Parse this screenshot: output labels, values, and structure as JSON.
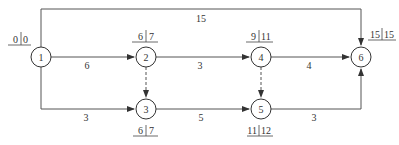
{
  "diagram": {
    "type": "network-schedule",
    "nodes": [
      {
        "id": "1",
        "label": "1",
        "est": "0",
        "lst": "0"
      },
      {
        "id": "2",
        "label": "2",
        "est": "6",
        "lst": "7"
      },
      {
        "id": "3",
        "label": "3",
        "est": "6",
        "lst": "7"
      },
      {
        "id": "4",
        "label": "4",
        "est": "9",
        "lst": "11"
      },
      {
        "id": "5",
        "label": "5",
        "est": "11",
        "lst": "12"
      },
      {
        "id": "6",
        "label": "6",
        "est": "15",
        "lst": "15"
      }
    ],
    "edges": [
      {
        "from": "1",
        "to": "6",
        "duration": "15",
        "style": "solid"
      },
      {
        "from": "1",
        "to": "2",
        "duration": "6",
        "style": "solid"
      },
      {
        "from": "1",
        "to": "3",
        "duration": "3",
        "style": "solid"
      },
      {
        "from": "2",
        "to": "4",
        "duration": "3",
        "style": "solid"
      },
      {
        "from": "3",
        "to": "5",
        "duration": "5",
        "style": "solid"
      },
      {
        "from": "4",
        "to": "6",
        "duration": "4",
        "style": "solid"
      },
      {
        "from": "5",
        "to": "6",
        "duration": "3",
        "style": "solid"
      },
      {
        "from": "2",
        "to": "3",
        "duration": "",
        "style": "dashed"
      },
      {
        "from": "4",
        "to": "5",
        "duration": "",
        "style": "dashed"
      }
    ]
  }
}
